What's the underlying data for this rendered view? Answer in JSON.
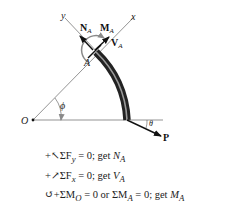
{
  "diagram": {
    "labels": {
      "origin": "O",
      "point": "A",
      "axis_x": "x",
      "axis_y": "y",
      "angle_phi": "ϕ",
      "angle_theta": "θ",
      "force_P": "P",
      "normal_force": "N",
      "normal_force_sub": "A",
      "shear_force": "V",
      "shear_force_sub": "A",
      "moment": "M",
      "moment_sub": "A"
    },
    "colors": {
      "line": "#555555",
      "arrow": "#111111",
      "bar_dark": "#2a2a2a",
      "bar_light": "#9a9a9a",
      "moment_arc": "#8a8a8a"
    }
  },
  "equations": [
    {
      "prefix": "+↖ΣF",
      "var_sub": "y",
      "mid": " = 0; get ",
      "result": "N",
      "result_sub": "A",
      "suffix": ""
    },
    {
      "prefix": "+↗ΣF",
      "var_sub": "x",
      "mid": " = 0; get ",
      "result": "V",
      "result_sub": "A",
      "suffix": ""
    },
    {
      "prefix": "↺+ΣM",
      "var_sub": "O",
      "mid": " = 0 or ΣM",
      "mid_sub": "A",
      "mid2": " = 0; get ",
      "result": "M",
      "result_sub": "A"
    }
  ]
}
